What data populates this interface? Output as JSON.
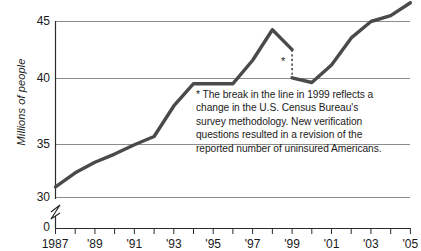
{
  "chart_data": {
    "type": "line",
    "title": "",
    "xlabel": "",
    "ylabel": "Millions of people",
    "ylim": [
      30,
      45
    ],
    "xlim": [
      1987,
      2005
    ],
    "grid": true,
    "legend": false,
    "axis_break": {
      "between": [
        0,
        30
      ],
      "symbol": "squiggle"
    },
    "y_ticks": [
      "0",
      "30",
      "35",
      "40",
      "45"
    ],
    "x_ticks": [
      "1987",
      "'89",
      "'91",
      "'93",
      "'95",
      "'97",
      "'99",
      "'01",
      "'03",
      "'05"
    ],
    "x_tick_years": [
      1987,
      1989,
      1991,
      1993,
      1995,
      1997,
      1999,
      2001,
      2003,
      2005
    ],
    "series": [
      {
        "name": "Uninsured Americans (pre-1999 methodology)",
        "x": [
          1987,
          1988,
          1989,
          1990,
          1991,
          1992,
          1993,
          1994,
          1995,
          1996,
          1997,
          1998,
          1999
        ],
        "values": [
          30.9,
          32.1,
          33.0,
          33.7,
          34.5,
          35.2,
          37.8,
          39.7,
          39.7,
          39.7,
          41.7,
          44.3,
          42.6
        ]
      },
      {
        "name": "Uninsured Americans (revised methodology)",
        "x": [
          1999,
          2000,
          2001,
          2002,
          2003,
          2004,
          2005
        ],
        "values": [
          40.2,
          39.8,
          41.3,
          43.6,
          45.0,
          45.5,
          46.6
        ]
      }
    ],
    "break_marker": {
      "year": 1999,
      "from_value": 42.6,
      "to_value": 40.2,
      "style": "dotted",
      "label": "*"
    },
    "annotation": {
      "lines": [
        "* The break in the line in 1999 reflects a",
        "change in the U.S. Census Bureau's",
        "survey methodology.  New verification",
        "questions resulted in a revision of the",
        "reported number of uninsured Americans."
      ]
    },
    "colors": {
      "line": "#4a4a4a",
      "grid": "#8c8c8c",
      "axis": "#2b2b2b",
      "text": "#1a1a1a",
      "background": "#ffffff"
    }
  }
}
